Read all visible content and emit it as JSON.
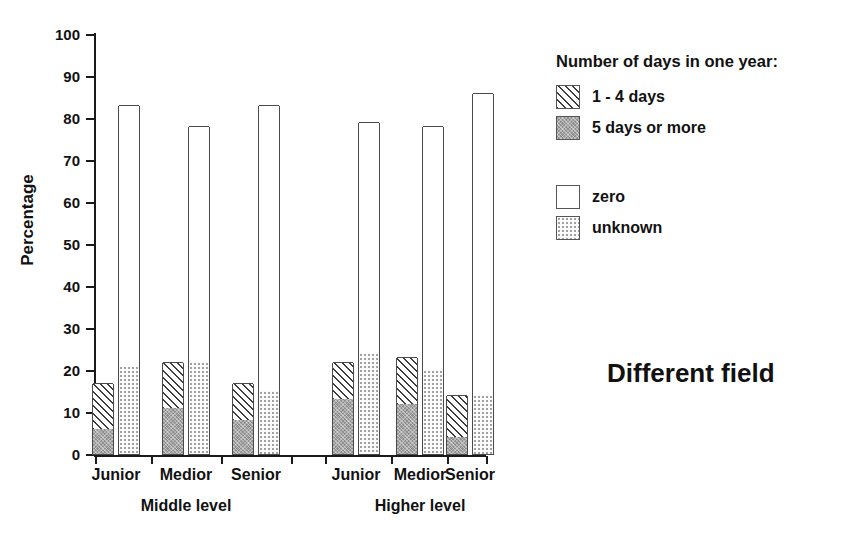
{
  "chart_data": {
    "type": "bar",
    "subtype": "grouped-stacked-bar",
    "title": "Different field",
    "xlabel": "",
    "ylabel": "Percentage",
    "ylim": [
      0,
      100
    ],
    "yticks": [
      0,
      10,
      20,
      30,
      40,
      50,
      60,
      70,
      80,
      90,
      100
    ],
    "grid": false,
    "legend_position": "right",
    "legend_title": "Number of days in one year:",
    "categories": [
      "Junior",
      "Medior",
      "Senior",
      "Junior",
      "Medior",
      "Senior"
    ],
    "group_labels": [
      "Middle level",
      "Higher level"
    ],
    "series": [
      {
        "name": "5 days or more",
        "pattern": "solid-gray",
        "bar": "left",
        "values": [
          6,
          11,
          8,
          13,
          12,
          4
        ]
      },
      {
        "name": "1 - 4 days",
        "pattern": "diagonal-hatch",
        "bar": "left",
        "values": [
          11,
          11,
          9,
          9,
          11,
          10
        ]
      },
      {
        "name": "unknown",
        "pattern": "dotted",
        "bar": "right",
        "values": [
          21,
          22,
          15,
          24,
          20,
          14
        ]
      },
      {
        "name": "zero",
        "pattern": "white",
        "bar": "right",
        "values": [
          62,
          56,
          68,
          55,
          58,
          72
        ]
      }
    ],
    "bar_totals_left": [
      17,
      22,
      17,
      22,
      23,
      14
    ],
    "bar_totals_right": [
      83,
      78,
      83,
      79,
      78,
      86
    ]
  },
  "axis": {
    "y_title": "Percentage",
    "y_tick_labels": [
      "100",
      "90",
      "80",
      "70",
      "60",
      "50",
      "40",
      "30",
      "20",
      "10",
      "0"
    ]
  },
  "x_axis": {
    "categories": [
      {
        "label": "Junior"
      },
      {
        "label": "Medior"
      },
      {
        "label": "Senior"
      },
      {
        "label": "Junior"
      },
      {
        "label": "Medior"
      },
      {
        "label": "Senior"
      }
    ],
    "groups": [
      {
        "label": "Middle level"
      },
      {
        "label": "Higher level"
      }
    ]
  },
  "legend": {
    "title": "Number of days in one year:",
    "items": [
      {
        "label": "1 - 4 days",
        "pattern": "diagonal-hatch"
      },
      {
        "label": "5 days or more",
        "pattern": "solid-gray"
      },
      {
        "label": "zero",
        "pattern": "white"
      },
      {
        "label": "unknown",
        "pattern": "dotted"
      }
    ]
  },
  "annotations": {
    "field_title": "Different field"
  },
  "colors": {
    "ink": "#111111",
    "axis": "#1a1a1a",
    "bar_outline": "#4a4a4a",
    "gray_fill": "#8e8e8e",
    "dot_fill": "#9a9a9a",
    "background": "#ffffff"
  }
}
